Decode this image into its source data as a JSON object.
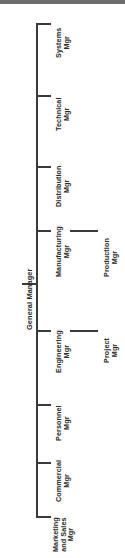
{
  "diagram": {
    "type": "organization-chart",
    "orientation": "rotated-90-counterclockwise",
    "root": {
      "label": "General Manager",
      "lines": [
        "General Manager"
      ]
    },
    "nodes": [
      {
        "id": "systems",
        "lines": [
          "Systems",
          "Mgr"
        ],
        "label": "Systems Mgr",
        "children": []
      },
      {
        "id": "technical",
        "lines": [
          "Technical",
          "Mgr"
        ],
        "label": "Technical Mgr",
        "children": []
      },
      {
        "id": "distribution",
        "lines": [
          "Distribution",
          "Mgr"
        ],
        "label": "Distribution Mgr",
        "children": []
      },
      {
        "id": "manufacturing",
        "lines": [
          "Manufacturing",
          "Mgr"
        ],
        "label": "Manufacturing Mgr",
        "children": [
          {
            "id": "production",
            "lines": [
              "Production",
              "Mgr"
            ],
            "label": "Production Mgr"
          }
        ]
      },
      {
        "id": "engineering",
        "lines": [
          "Engineering",
          "Mgr"
        ],
        "label": "Engineering Mgr",
        "children": [
          {
            "id": "project",
            "lines": [
              "Project",
              "Mgr"
            ],
            "label": "Project Mgr"
          }
        ]
      },
      {
        "id": "personnel",
        "lines": [
          "Personnel",
          "Mgr"
        ],
        "label": "Personnel Mgr",
        "children": []
      },
      {
        "id": "commercial",
        "lines": [
          "Commercial",
          "Mgr"
        ],
        "label": "Commercial Mgr",
        "children": []
      },
      {
        "id": "marketing-and-sales",
        "lines": [
          "Marketing",
          "and Sales",
          "Mgr"
        ],
        "label": "Marketing and Sales Mgr",
        "children": []
      }
    ],
    "colors": {
      "line": "#3a3a3a",
      "text": "#272727",
      "background": "#ffffff",
      "top_band": "#6d6d6d"
    }
  }
}
